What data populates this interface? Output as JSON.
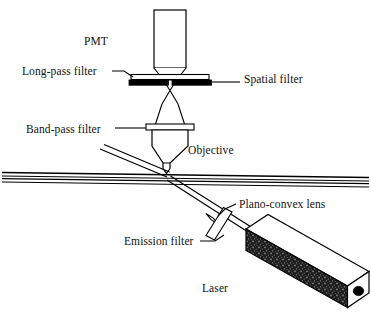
{
  "figure": {
    "background_color": "#ffffff",
    "stroke_color": "#000000",
    "width": 371,
    "height": 319
  },
  "labels": {
    "pmt": "PMT",
    "long_pass_filter": "Long-pass filter",
    "spatial_filter": "Spatial filter",
    "band_pass_filter": "Band-pass filter",
    "objective": "Objective",
    "plano_convex_lens": "Plano-convex lens",
    "emission_filter": "Emission filter",
    "laser": "Laser"
  },
  "components": [
    {
      "name": "pmt",
      "label": "PMT",
      "shape": "rectangle-with-tapered-nose",
      "description": "Photomultiplier tube detector at top of optical axis"
    },
    {
      "name": "long-pass-filter",
      "label": "Long-pass filter",
      "shape": "thin-horizontal-slab",
      "fill": "#ffffff",
      "description": "White horizontal slab above the spatial filter"
    },
    {
      "name": "spatial-filter",
      "label": "Spatial filter",
      "shape": "thin-horizontal-bar",
      "fill": "#000000",
      "description": "Black pinhole bar with central aperture"
    },
    {
      "name": "band-pass-filter",
      "label": "Band-pass filter",
      "shape": "thin-horizontal-slab",
      "fill": "#ffffff",
      "description": "White horizontal slab above the objective"
    },
    {
      "name": "objective",
      "label": "Objective",
      "shape": "tapered-barrel",
      "description": "Microscope objective focusing onto the capillary"
    },
    {
      "name": "capillary",
      "label": "",
      "shape": "horizontal-tube",
      "description": "Slightly tilted capillary / flow channel spanning the figure"
    },
    {
      "name": "plano-convex-lens",
      "label": "Plano-convex lens",
      "shape": "small-lens",
      "description": "Lens on the excitation beam path"
    },
    {
      "name": "emission-filter",
      "label": "Emission filter",
      "shape": "tilted-slab",
      "description": "Angled filter slab between laser and lens"
    },
    {
      "name": "laser",
      "label": "Laser",
      "shape": "isometric-box",
      "fill": "#2a2a2a",
      "description": "Laser source drawn as a 3D box with speckled dark body and circular output aperture"
    }
  ],
  "beams": [
    {
      "name": "excitation-beam",
      "from": "laser",
      "to": "capillary",
      "style": "solid-double-line"
    },
    {
      "name": "collection-cone-lower",
      "from": "capillary",
      "to": "objective",
      "style": "cone"
    },
    {
      "name": "collection-cone-upper",
      "from": "objective",
      "to": "pmt",
      "style": "double-cone-through-pinhole"
    }
  ]
}
